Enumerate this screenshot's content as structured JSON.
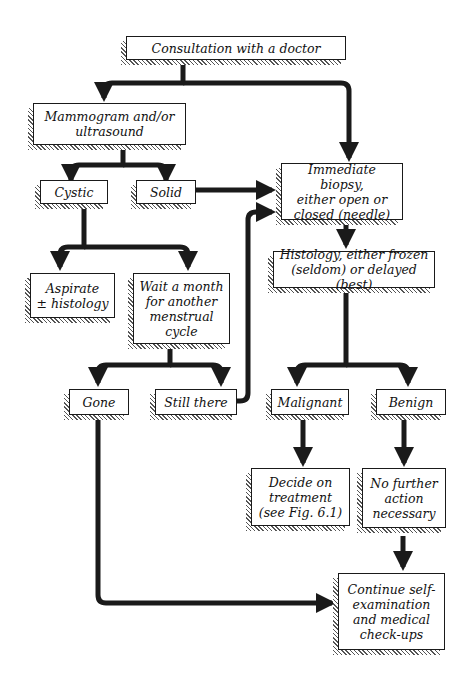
{
  "diagram": {
    "type": "flowchart",
    "nodes": {
      "consultation": "Consultation with a doctor",
      "mammogram": "Mammogram and/or\nultrasound",
      "cystic": "Cystic",
      "solid": "Solid",
      "biopsy": "Immediate biopsy,\neither open or\nclosed (needle)",
      "aspirate": "Aspirate\n± histology",
      "wait": "Wait a month\nfor another\nmenstrual\ncycle",
      "histology": "Histology, either frozen\n(seldom) or delayed (best)",
      "gone": "Gone",
      "still_there": "Still there",
      "malignant": "Malignant",
      "benign": "Benign",
      "decide": "Decide on\ntreatment\n(see Fig. 6.1)",
      "no_action": "No further\naction\nnecessary",
      "continue": "Continue self-\nexamination\nand medical\ncheck-ups"
    },
    "edges": [
      {
        "from": "consultation",
        "to": "mammogram"
      },
      {
        "from": "consultation",
        "to": "biopsy"
      },
      {
        "from": "mammogram",
        "to": "cystic"
      },
      {
        "from": "mammogram",
        "to": "solid"
      },
      {
        "from": "solid",
        "to": "biopsy"
      },
      {
        "from": "cystic",
        "to": "aspirate"
      },
      {
        "from": "cystic",
        "to": "wait"
      },
      {
        "from": "wait",
        "to": "gone"
      },
      {
        "from": "wait",
        "to": "still_there"
      },
      {
        "from": "still_there",
        "to": "biopsy"
      },
      {
        "from": "biopsy",
        "to": "histology"
      },
      {
        "from": "histology",
        "to": "malignant"
      },
      {
        "from": "histology",
        "to": "benign"
      },
      {
        "from": "malignant",
        "to": "decide"
      },
      {
        "from": "benign",
        "to": "no_action"
      },
      {
        "from": "no_action",
        "to": "continue"
      },
      {
        "from": "gone",
        "to": "continue"
      }
    ],
    "colors": {
      "line": "#1a1a1a",
      "box_fill": "#ffffff",
      "hatch": "#555555"
    }
  }
}
